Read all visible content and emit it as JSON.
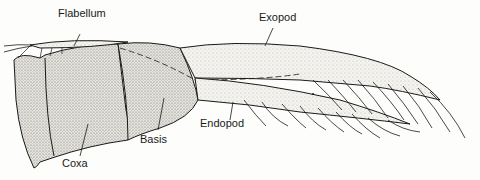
{
  "diagram": {
    "labels": {
      "flabellum": "Flabellum",
      "exopod": "Exopod",
      "endopod": "Endopod",
      "basis": "Basis",
      "coxa": "Coxa"
    },
    "colors": {
      "ink": "#1a1a1a",
      "stipple": "#d8d6d0",
      "background": "#fdfdfb"
    }
  }
}
